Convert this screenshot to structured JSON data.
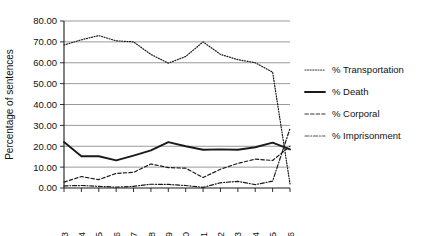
{
  "chart_data": {
    "type": "line",
    "title": "",
    "xlabel": "",
    "ylabel": "Percentage of sentences",
    "ylim": [
      0,
      80
    ],
    "ytick_step": 10,
    "grid": true,
    "legend_position": "right",
    "categories": [
      "1763",
      "1764",
      "1765",
      "1766",
      "1767",
      "1768",
      "1769",
      "1770",
      "1771",
      "1772",
      "1773",
      "1774",
      "1775",
      "1776"
    ],
    "ytick_labels": [
      "0.00",
      "10.00",
      "20.00",
      "30.00",
      "40.00",
      "50.00",
      "60.00",
      "70.00",
      "80.00"
    ],
    "ytick_values": [
      0,
      10,
      20,
      30,
      40,
      50,
      60,
      70,
      80
    ],
    "series": [
      {
        "name": "% Transportation",
        "style": "dotted",
        "color": "#333333",
        "values": [
          68.5,
          71.0,
          73.0,
          70.5,
          70.0,
          64.0,
          59.8,
          63.0,
          70.0,
          64.0,
          61.5,
          60.0,
          55.5,
          2.0
        ]
      },
      {
        "name": "% Death",
        "style": "solid",
        "color": "#1a1a1a",
        "values": [
          22.0,
          15.2,
          15.2,
          13.2,
          15.5,
          18.0,
          22.0,
          20.0,
          18.3,
          18.5,
          18.3,
          19.5,
          21.7,
          18.5
        ]
      },
      {
        "name": "% Corporal",
        "style": "dashed",
        "color": "#333333",
        "values": [
          2.8,
          5.5,
          4.0,
          7.0,
          7.5,
          11.5,
          9.8,
          9.5,
          5.0,
          9.0,
          11.8,
          13.8,
          13.2,
          20.0
        ]
      },
      {
        "name": "% Imprisonment",
        "style": "dashdot",
        "color": "#555555",
        "values": [
          1.0,
          1.2,
          0.8,
          0.4,
          0.8,
          1.8,
          1.7,
          1.2,
          0.3,
          2.5,
          3.2,
          1.6,
          3.3,
          28.5
        ]
      }
    ]
  },
  "legend": {
    "items": [
      {
        "label": "% Transportation"
      },
      {
        "label": "% Death"
      },
      {
        "label": "% Corporal"
      },
      {
        "label": "% Imprisonment"
      }
    ]
  }
}
